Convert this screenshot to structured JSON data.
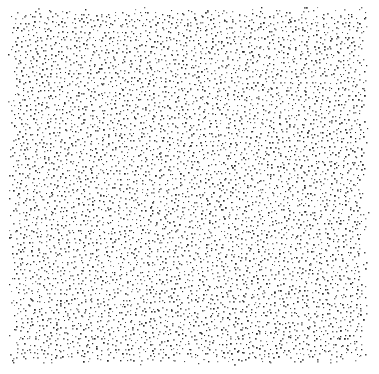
{
  "canvas": {
    "width": 379,
    "height": 374,
    "background": "#ffffff"
  },
  "pattern": {
    "type": "stipple-point-set",
    "region": {
      "x0": 8,
      "y0": 8,
      "x1": 367,
      "y1": 363
    },
    "spacing": 4.6,
    "jitter": 0.45,
    "dot_size_min": 1.0,
    "dot_size_max": 1.8,
    "colors": [
      "#2a2a2a",
      "#4a4a4a",
      "#6a6a6a",
      "#8a8a8a"
    ],
    "edge_fade": 10,
    "seed": 1337
  }
}
